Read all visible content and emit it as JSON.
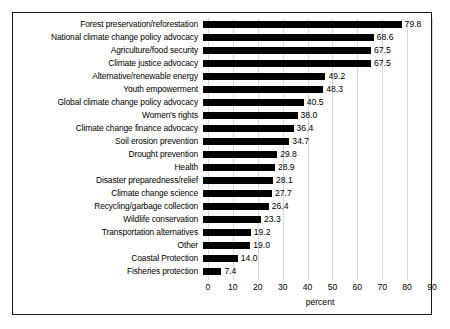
{
  "chart_data": {
    "type": "bar",
    "orientation": "horizontal",
    "title": "",
    "xlabel": "percent",
    "ylabel": "",
    "xlim": [
      0,
      90
    ],
    "xticks": [
      0,
      10,
      20,
      30,
      40,
      50,
      60,
      70,
      80,
      90
    ],
    "grid": "vertical",
    "legend": "none",
    "bar_color": "#000000",
    "value_label_format": "one-decimal",
    "categories": [
      "Forest preservation/reforestation",
      "National climate change policy advocacy",
      "Agriculture/food security",
      "Climate justice advocacy",
      "Alternative/renewable energy",
      "Youth empowerment",
      "Global climate change policy advocacy",
      "Women's rights",
      "Climate change finance advocacy",
      "Soil erosion prevention",
      "Drought prevention",
      "Health",
      "Disaster preparedness/relief",
      "Climate change science",
      "Recycling/garbage collection",
      "Wildlife conservation",
      "Transportation alternatives",
      "Other",
      "Coastal Protection",
      "Fisheries protection"
    ],
    "values": [
      79.8,
      68.6,
      67.5,
      67.5,
      49.2,
      48.3,
      40.5,
      38.0,
      36.4,
      34.7,
      29.8,
      28.9,
      28.1,
      27.7,
      26.4,
      23.3,
      19.2,
      19.0,
      14.0,
      7.4
    ],
    "value_labels": [
      "79.8",
      "68.6",
      "67.5",
      "67.5",
      "49.2",
      "48.3",
      "40.5",
      "38.0",
      "36.4",
      "34.7",
      "29.8",
      "28.9",
      "28.1",
      "27.7",
      "26.4",
      "23.3",
      "19.2",
      "19.0",
      "14.0",
      "7.4"
    ]
  }
}
